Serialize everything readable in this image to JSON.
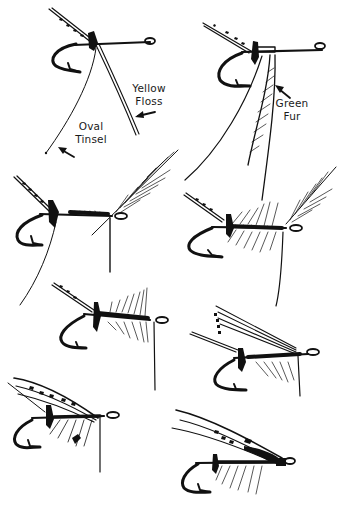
{
  "figure": {
    "type": "fly-tying step illustration",
    "step_count": 8,
    "ink_color": "#111111",
    "background_color": "#ffffff",
    "labels": {
      "yellow_floss": [
        "Yellow",
        "Floss"
      ],
      "oval_tinsel": [
        "Oval",
        "Tinsel"
      ],
      "green_fur": [
        "Green",
        "Fur"
      ]
    },
    "steps": [
      {
        "id": 1,
        "position": "top-left",
        "description": "Tail tied in; yellow floss and oval tinsel attached"
      },
      {
        "id": 2,
        "position": "top-right",
        "description": "Green fur dubbed onto thread"
      },
      {
        "id": 3,
        "position": "row2-left",
        "description": "Body wound, hackle feather tied in at head"
      },
      {
        "id": 4,
        "position": "row2-right",
        "description": "Hackle wound palmer-style along body"
      },
      {
        "id": 5,
        "position": "row3-left",
        "description": "Hackle fibres stroked back"
      },
      {
        "id": 6,
        "position": "row3-right",
        "description": "Wing slips tied on"
      },
      {
        "id": 7,
        "position": "row4-left",
        "description": "Wing set over body"
      },
      {
        "id": 8,
        "position": "row4-right",
        "description": "Finished fly with head varnished"
      }
    ]
  }
}
